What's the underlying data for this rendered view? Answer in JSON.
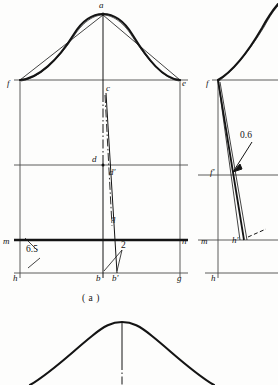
{
  "figure": {
    "caption": "( a )",
    "colors": {
      "ink": "#141414",
      "grid": "#4a4a4a",
      "paper": "#fdfdfc"
    }
  },
  "left_view": {
    "name": "front-view",
    "points": [
      {
        "id": "a",
        "label": "a",
        "x": 103,
        "y": 14,
        "lx": 99,
        "ly": 2,
        "kind": "apex"
      },
      {
        "id": "f",
        "label": "f",
        "x": 20,
        "y": 80,
        "lx": 8,
        "ly": 82,
        "kind": "corner"
      },
      {
        "id": "e",
        "label": "e",
        "x": 180,
        "y": 80,
        "lx": 182,
        "ly": 82,
        "kind": "corner"
      },
      {
        "id": "c",
        "label": "c",
        "x": 103,
        "y": 93,
        "lx": 106,
        "ly": 86,
        "kind": "station"
      },
      {
        "id": "d",
        "label": "d",
        "x": 103,
        "y": 165,
        "lx": 92,
        "ly": 157,
        "kind": "station"
      },
      {
        "id": "dp",
        "label": "d'",
        "x": 108,
        "y": 175,
        "lx": 108,
        "ly": 168,
        "kind": "station"
      },
      {
        "id": "q",
        "label": "q",
        "x": 112,
        "y": 226,
        "lx": 111,
        "ly": 216,
        "kind": "station"
      },
      {
        "id": "m",
        "label": "m",
        "x": 20,
        "y": 240,
        "lx": 4,
        "ly": 240,
        "kind": "corner"
      },
      {
        "id": "n",
        "label": "n",
        "x": 180,
        "y": 240,
        "lx": 182,
        "ly": 240,
        "kind": "corner"
      },
      {
        "id": "h",
        "label": "h",
        "x": 20,
        "y": 273,
        "lx": 14,
        "ly": 274,
        "kind": "corner"
      },
      {
        "id": "g",
        "label": "g",
        "x": 180,
        "y": 273,
        "lx": 178,
        "ly": 274,
        "kind": "corner"
      },
      {
        "id": "b",
        "label": "b",
        "x": 103,
        "y": 273,
        "lx": 96,
        "ly": 274,
        "kind": "corner"
      },
      {
        "id": "bp",
        "label": "b'",
        "x": 117,
        "y": 273,
        "lx": 112,
        "ly": 274,
        "kind": "corner"
      }
    ],
    "dimensions": [
      {
        "id": "dim-6-5",
        "value": "6.5",
        "lx": 26,
        "ly": 247,
        "between": [
          "m-n line",
          "h-g line"
        ]
      },
      {
        "id": "dim-2",
        "value": "2",
        "lx": 123,
        "ly": 245,
        "between": [
          "b",
          "b'"
        ]
      }
    ]
  },
  "right_view": {
    "name": "side-view",
    "points": [
      {
        "id": "f",
        "label": "f",
        "x": 218,
        "y": 80,
        "lx": 207,
        "ly": 82,
        "kind": "corner"
      },
      {
        "id": "fp",
        "label": "f'",
        "x": 228,
        "y": 175,
        "lx": 211,
        "ly": 170,
        "kind": "station"
      },
      {
        "id": "m",
        "label": "m",
        "x": 218,
        "y": 240,
        "lx": 202,
        "ly": 240,
        "kind": "corner"
      },
      {
        "id": "hp",
        "label": "h'",
        "x": 242,
        "y": 240,
        "lx": 233,
        "ly": 240,
        "kind": "station"
      },
      {
        "id": "h",
        "label": "h",
        "x": 218,
        "y": 273,
        "lx": 212,
        "ly": 274,
        "kind": "corner"
      }
    ],
    "dimensions": [
      {
        "id": "dim-0-6",
        "value": "0.6",
        "lx": 243,
        "ly": 136,
        "between": [
          "profile",
          "chord"
        ]
      }
    ]
  },
  "bottom_view": {
    "name": "second-profile-partial",
    "note": "bell curve with centre line, cropped at page edge"
  }
}
